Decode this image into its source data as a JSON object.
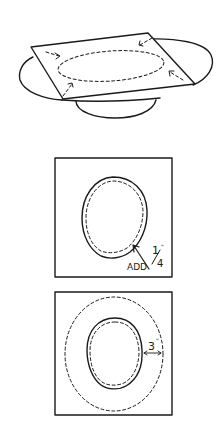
{
  "figures": [
    {
      "id": "plate-with-paper",
      "description": "Square of paper laid over a plate, oval traced with dashed line, corners pressed down"
    },
    {
      "id": "traced-oval",
      "annotation": {
        "text_add": "ADD",
        "text_measure": "1/4\"",
        "numerator": "1",
        "denominator": "4",
        "inch_mark": "\""
      }
    },
    {
      "id": "outer-margin",
      "annotation": {
        "text_measure": "3\"",
        "value": "3",
        "inch_mark": "\""
      }
    }
  ],
  "colors": {
    "ink": "#1a1a1a",
    "background": "#ffffff"
  }
}
